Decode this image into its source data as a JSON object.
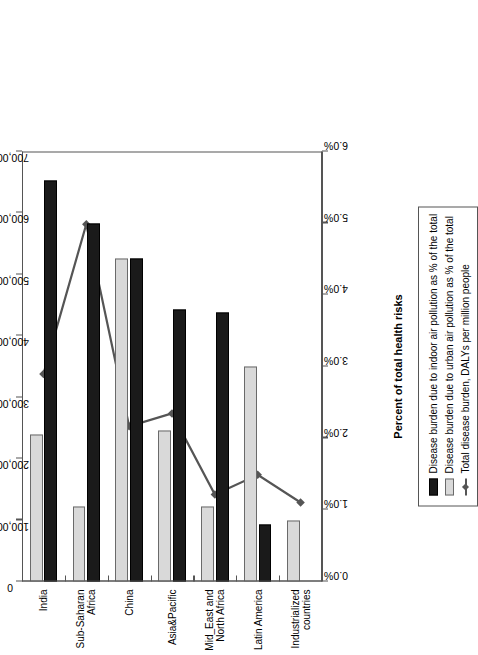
{
  "chart_data": {
    "type": "bar",
    "title": "",
    "categories": [
      "India",
      "Sub-Saharan Africa",
      "China",
      "Asia&Pacific",
      "Mid_East and North Africa",
      "Latin America",
      "Industrialized countries"
    ],
    "category_lines": [
      [
        "India"
      ],
      [
        "Sub-Saharan",
        "Africa"
      ],
      [
        "China"
      ],
      [
        "Asia&Pacific"
      ],
      [
        "Mid_East and",
        "North Africa"
      ],
      [
        "Latin America"
      ],
      [
        "Industrialized",
        "countries"
      ]
    ],
    "series": [
      {
        "name": "Disease burden due to indoor air pollution as % of the total",
        "axis": "primary",
        "kind": "bar",
        "color": "#1a1a1a",
        "values": [
          5.6,
          5.0,
          4.5,
          3.8,
          3.75,
          0.8,
          0.0
        ]
      },
      {
        "name": "Disease burden due to urban air pollution as % of the total",
        "axis": "primary",
        "kind": "bar",
        "color": "#d9d9d9",
        "values": [
          2.05,
          1.05,
          4.5,
          2.1,
          1.05,
          3.0,
          0.85
        ]
      },
      {
        "name": "Total disease burden, DALYs per million people",
        "axis": "secondary",
        "kind": "line",
        "color": "#555555",
        "values": [
          336000,
          580000,
          251000,
          272000,
          140000,
          172000,
          127000
        ]
      }
    ],
    "primary_axis": {
      "label": "Percent of total health risks",
      "ticks": [
        "0.0%",
        "1.0%",
        "2.0%",
        "3.0%",
        "4.0%",
        "5.0%",
        "6.0%"
      ],
      "min": 0.0,
      "max": 6.0,
      "step": 1.0
    },
    "secondary_axis": {
      "label": "DALYs per million people",
      "ticks": [
        "0",
        "100,000",
        "200,000",
        "300,000",
        "400,000",
        "500,000",
        "600,000",
        "700,000"
      ],
      "min": 0,
      "max": 700000,
      "step": 100000
    },
    "legend": {
      "position": "right",
      "entries": [
        {
          "label": "Disease burden due to indoor air pollution as % of the total",
          "marker": "indoor"
        },
        {
          "label": "Disease burden due to urban air pollution as % of the total",
          "marker": "urban"
        },
        {
          "label": "Total disease burden, DALYs per million people",
          "marker": "line"
        }
      ]
    },
    "grid": false
  }
}
